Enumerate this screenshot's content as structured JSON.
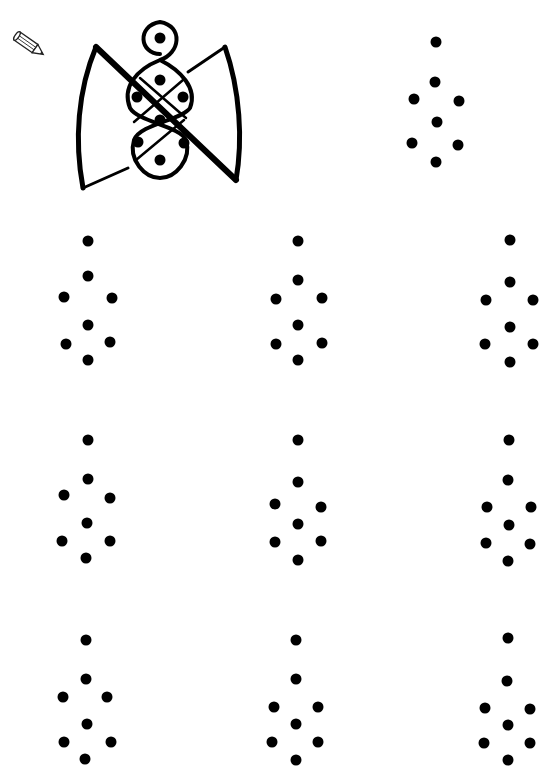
{
  "page": {
    "top_text_fragment": "",
    "background": "#ffffff",
    "ink_color": "#000000"
  },
  "icons": {
    "pencil": "pencil-icon"
  },
  "example": {
    "label": "butterfly-kolam-example",
    "dots": [
      [
        160,
        38
      ],
      [
        160,
        80
      ],
      [
        137,
        97
      ],
      [
        183,
        97
      ],
      [
        160,
        120
      ],
      [
        138,
        142
      ],
      [
        184,
        143
      ],
      [
        160,
        160
      ]
    ]
  },
  "template_pattern": {
    "dots": [
      [
        436,
        42
      ],
      [
        435,
        82
      ],
      [
        414,
        99
      ],
      [
        459,
        101
      ],
      [
        437,
        122
      ],
      [
        412,
        143
      ],
      [
        458,
        145
      ],
      [
        436,
        162
      ]
    ]
  },
  "grid": {
    "rows": 3,
    "cols": 3,
    "patterns": [
      {
        "row": 1,
        "col": 1,
        "dots": [
          [
            88,
            241
          ],
          [
            88,
            276
          ],
          [
            64,
            297
          ],
          [
            112,
            298
          ],
          [
            88,
            325
          ],
          [
            66,
            344
          ],
          [
            110,
            342
          ],
          [
            88,
            360
          ]
        ]
      },
      {
        "row": 1,
        "col": 2,
        "dots": [
          [
            298,
            241
          ],
          [
            298,
            280
          ],
          [
            276,
            299
          ],
          [
            322,
            298
          ],
          [
            298,
            325
          ],
          [
            276,
            344
          ],
          [
            322,
            343
          ],
          [
            298,
            360
          ]
        ]
      },
      {
        "row": 1,
        "col": 3,
        "dots": [
          [
            510,
            240
          ],
          [
            510,
            282
          ],
          [
            486,
            300
          ],
          [
            533,
            300
          ],
          [
            510,
            327
          ],
          [
            485,
            344
          ],
          [
            533,
            344
          ],
          [
            510,
            362
          ]
        ]
      },
      {
        "row": 2,
        "col": 1,
        "dots": [
          [
            88,
            440
          ],
          [
            88,
            479
          ],
          [
            64,
            495
          ],
          [
            110,
            498
          ],
          [
            87,
            523
          ],
          [
            62,
            541
          ],
          [
            110,
            541
          ],
          [
            86,
            558
          ]
        ]
      },
      {
        "row": 2,
        "col": 2,
        "dots": [
          [
            298,
            440
          ],
          [
            298,
            482
          ],
          [
            275,
            504
          ],
          [
            321,
            507
          ],
          [
            298,
            524
          ],
          [
            275,
            542
          ],
          [
            321,
            541
          ],
          [
            298,
            560
          ]
        ]
      },
      {
        "row": 2,
        "col": 3,
        "dots": [
          [
            509,
            440
          ],
          [
            508,
            480
          ],
          [
            487,
            507
          ],
          [
            531,
            507
          ],
          [
            509,
            525
          ],
          [
            486,
            543
          ],
          [
            530,
            544
          ],
          [
            508,
            561
          ]
        ]
      },
      {
        "row": 3,
        "col": 1,
        "dots": [
          [
            86,
            640
          ],
          [
            86,
            679
          ],
          [
            63,
            697
          ],
          [
            107,
            697
          ],
          [
            87,
            724
          ],
          [
            64,
            742
          ],
          [
            111,
            742
          ],
          [
            85,
            759
          ]
        ]
      },
      {
        "row": 3,
        "col": 2,
        "dots": [
          [
            296,
            640
          ],
          [
            296,
            679
          ],
          [
            274,
            707
          ],
          [
            318,
            707
          ],
          [
            296,
            724
          ],
          [
            272,
            742
          ],
          [
            318,
            742
          ],
          [
            296,
            760
          ]
        ]
      },
      {
        "row": 3,
        "col": 3,
        "dots": [
          [
            508,
            638
          ],
          [
            507,
            681
          ],
          [
            485,
            708
          ],
          [
            530,
            709
          ],
          [
            508,
            725
          ],
          [
            484,
            743
          ],
          [
            530,
            743
          ],
          [
            508,
            760
          ]
        ]
      }
    ]
  }
}
